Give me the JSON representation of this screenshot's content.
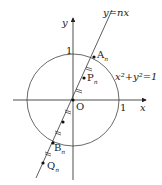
{
  "diagram": {
    "line_label": "y=nx",
    "circle_label": "x²+y²=1",
    "axis_x_label": "x",
    "axis_y_label": "y",
    "origin_label": "O",
    "tick_x_label": "1",
    "tick_y_label": "1",
    "points": {
      "A": "A",
      "A_sub": "n",
      "P": "P",
      "P_sub": "n",
      "B": "B",
      "B_sub": "n",
      "Q": "Q",
      "Q_sub": "n"
    },
    "colors": {
      "stroke": "#222222",
      "background": "#ffffff"
    }
  }
}
